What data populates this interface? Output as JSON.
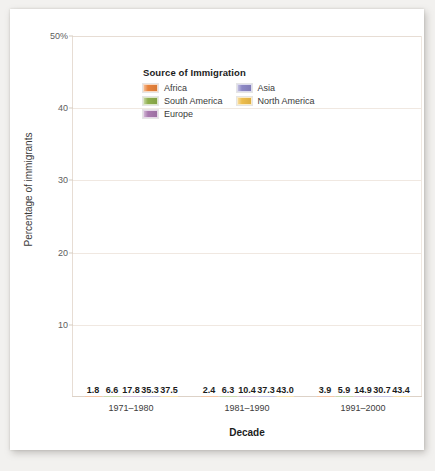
{
  "chart_data": {
    "type": "bar",
    "title": "",
    "xlabel": "Decade",
    "ylabel": "Percentage of immigrants",
    "legend_title": "Source of Immigration",
    "legend_position": "top-left inside plot",
    "grid": true,
    "ylim": [
      0,
      50
    ],
    "yticks": [
      10,
      20,
      30,
      40,
      50
    ],
    "ytick_labels": [
      "10",
      "20",
      "30",
      "40",
      "50%"
    ],
    "categories": [
      "1971–1980",
      "1981–1990",
      "1991–2000"
    ],
    "series": [
      {
        "name": "Africa",
        "color": "#e8823a",
        "values": [
          1.8,
          2.4,
          3.9
        ]
      },
      {
        "name": "South America",
        "color": "#8dae4a",
        "values": [
          6.6,
          6.3,
          5.9
        ]
      },
      {
        "name": "Europe",
        "color": "#a878ae",
        "values": [
          17.8,
          10.4,
          14.9
        ]
      },
      {
        "name": "Asia",
        "color": "#8b86c4",
        "values": [
          35.3,
          37.3,
          30.7
        ]
      },
      {
        "name": "North America",
        "color": "#edbc4a",
        "values": [
          37.5,
          43.0,
          43.4
        ]
      }
    ],
    "value_labels": [
      [
        "1.8",
        "6.6",
        "17.8",
        "35.3",
        "37.5"
      ],
      [
        "2.4",
        "6.3",
        "10.4",
        "37.3",
        "43.0"
      ],
      [
        "3.9",
        "5.9",
        "14.9",
        "30.7",
        "43.4"
      ]
    ]
  },
  "colors": {
    "card_background": "#ffffff",
    "page_background": "#f2f1ef",
    "gridline": "#f0e8e1",
    "axis": "#e7ddd4",
    "text": "#1c1c1c"
  }
}
